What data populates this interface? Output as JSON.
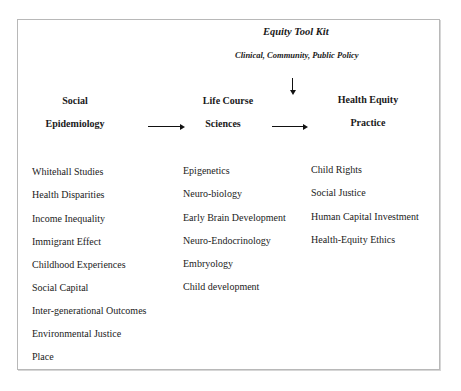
{
  "toolkit": {
    "title": "Equity Tool Kit",
    "subtitle": "Clinical, Community, Public Policy"
  },
  "columns": [
    {
      "heading_line1": "Social",
      "heading_line2": "Epidemiology",
      "items": [
        "Whitehall Studies",
        "Health Disparities",
        "Income Inequality",
        "Immigrant Effect",
        "Childhood  Experiences",
        "Social Capital",
        "Inter-generational Outcomes",
        "Environmental Justice",
        "Place"
      ]
    },
    {
      "heading_line1": "Life Course",
      "heading_line2": "Sciences",
      "items": [
        "Epigenetics",
        "Neuro-biology",
        "Early Brain Development",
        "Neuro-Endocrinology",
        "Embryology",
        "Child development"
      ]
    },
    {
      "heading_line1": "Health Equity",
      "heading_line2": "Practice",
      "items": [
        "Child Rights",
        "Social Justice",
        "Human Capital Investment",
        "Health-Equity Ethics"
      ]
    }
  ],
  "arrows": [
    {
      "from": "Social Epidemiology",
      "to": "Life Course Sciences",
      "direction": "right"
    },
    {
      "from": "Life Course Sciences",
      "to": "Health Equity Practice",
      "direction": "right"
    },
    {
      "from": "Equity Tool Kit",
      "to": "Health Equity Practice",
      "direction": "down"
    }
  ]
}
